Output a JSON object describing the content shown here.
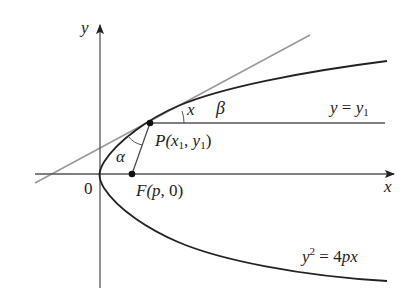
{
  "diagram": {
    "axes": {
      "x_label": "x",
      "y_label": "y",
      "origin_label": "0"
    },
    "points": {
      "P": {
        "label_prefix": "P(",
        "x": "x",
        "x_sub": "1",
        "sep": ", ",
        "y": "y",
        "y_sub": "1",
        "suffix": ")"
      },
      "F": {
        "label_prefix": "F(",
        "var": "p",
        "suffix": ", 0)"
      }
    },
    "angles": {
      "alpha": "α",
      "beta": "β"
    },
    "line_label": {
      "lhs": "y",
      "eq": " = ",
      "rhs": "y",
      "rhs_sub": "1"
    },
    "curve_label": {
      "y": "y",
      "exp": "2",
      "rest": " = 4",
      "p": "p",
      "x": "x"
    },
    "colors": {
      "curve": "#222222",
      "tangent": "#999999",
      "axis": "#444444"
    }
  }
}
